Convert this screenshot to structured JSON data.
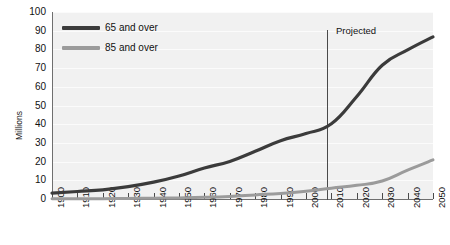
{
  "chart_data": {
    "type": "line",
    "title": "",
    "xlabel": "",
    "ylabel": "Millions",
    "xlim": [
      1900,
      2050
    ],
    "ylim": [
      0,
      100
    ],
    "grid": true,
    "legend_position": "top-left",
    "x": [
      1900,
      1910,
      1920,
      1930,
      1940,
      1950,
      1960,
      1970,
      1980,
      1990,
      2000,
      2010,
      2020,
      2030,
      2040,
      2050
    ],
    "xticklabels": [
      "1900",
      "1910",
      "1920",
      "1930",
      "1940",
      "1950",
      "1960",
      "1970",
      "1980",
      "1990",
      "2000",
      "2010",
      "2020",
      "2030",
      "2040",
      "2050"
    ],
    "yticks": [
      0,
      10,
      20,
      30,
      40,
      50,
      60,
      70,
      80,
      90,
      100
    ],
    "yticklabels": [
      "0",
      "10",
      "20",
      "30",
      "40",
      "50",
      "60",
      "70",
      "80",
      "90",
      "100"
    ],
    "series": [
      {
        "name": "65 and over",
        "color": "#3b3b3b",
        "values": [
          3.1,
          4.0,
          4.9,
          6.6,
          9.0,
          12.3,
          16.6,
          20.1,
          25.5,
          31.2,
          35.0,
          40.2,
          54.8,
          71.5,
          79.7,
          86.7
        ]
      },
      {
        "name": "85 and over",
        "color": "#9b9b9b",
        "values": [
          0.1,
          0.2,
          0.2,
          0.3,
          0.4,
          0.6,
          0.9,
          1.4,
          2.2,
          3.0,
          4.2,
          5.8,
          7.3,
          9.6,
          15.4,
          20.9
        ]
      }
    ],
    "annotations": [
      {
        "text": "Projected",
        "at_x": 2010,
        "kind": "divider-label"
      }
    ],
    "colors": {
      "plot_background": "#f1f1f1",
      "gridline": "#fbfbfb",
      "axis": "#6f6f6f",
      "divider": "#4a4a4a",
      "text": "#111111"
    }
  },
  "legend": {
    "items": [
      {
        "label": "65 and over",
        "color": "#3b3b3b"
      },
      {
        "label": "85 and over",
        "color": "#9b9b9b"
      }
    ]
  }
}
